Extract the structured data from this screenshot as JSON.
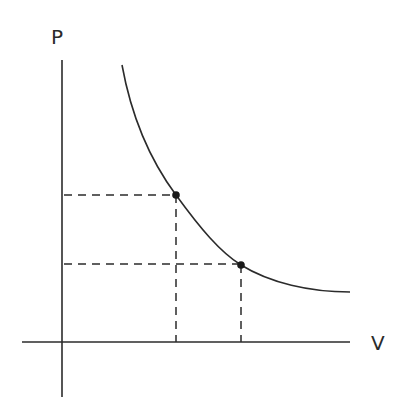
{
  "diagram": {
    "type": "pressure-volume isotherm",
    "y_axis_label": "P",
    "x_axis_label": "V",
    "curve": "hyperbola (PV = constant)",
    "points": [
      {
        "name": "point-1",
        "x": 176,
        "y": 195
      },
      {
        "name": "point-2",
        "x": 241,
        "y": 265
      }
    ],
    "colors": {
      "ink": "#2b2b2b",
      "background": "#ffffff"
    }
  }
}
